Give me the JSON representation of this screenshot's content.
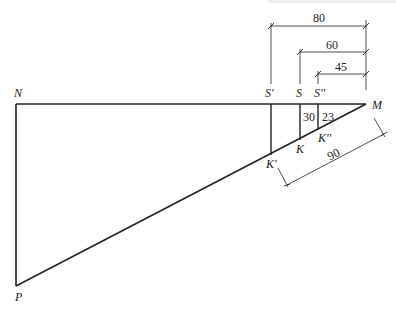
{
  "diagram": {
    "points": {
      "N": "N",
      "M": "M",
      "P": "P",
      "S_prime": "S'",
      "S": "S",
      "S_dprime": "S''",
      "K_prime": "K'",
      "K": "K",
      "K_dprime": "K''"
    },
    "dimensions": {
      "MS_prime": "80",
      "MS": "60",
      "MS_dprime": "45",
      "SK": "30",
      "S_dprime_K_dprime": "23",
      "MK_prime": "90"
    }
  }
}
